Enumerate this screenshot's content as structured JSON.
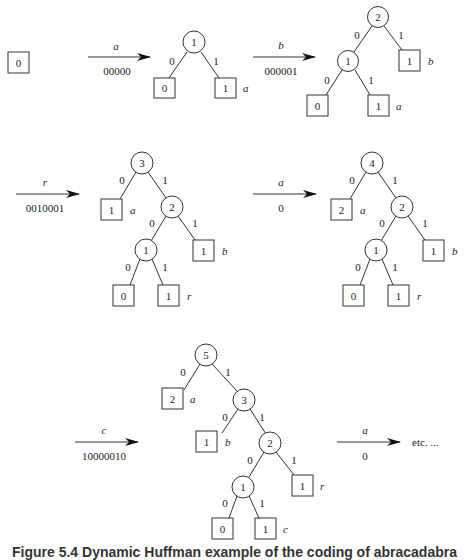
{
  "figure": {
    "caption": "Figure 5.4   Dynamic Huffman example of the coding of abracadabra",
    "etc_label": "etc. ..."
  },
  "initial_tree": {
    "leaf_weight": "0"
  },
  "transitions": [
    {
      "symbol": "a",
      "code": "00000"
    },
    {
      "symbol": "b",
      "code": "000001"
    },
    {
      "symbol": "r",
      "code": "0010001"
    },
    {
      "symbol": "a",
      "code": "0"
    },
    {
      "symbol": "c",
      "code": "10000010"
    },
    {
      "symbol": "a",
      "code": "0"
    }
  ],
  "edge_labels": {
    "left": "0",
    "right": "1"
  },
  "trees": [
    {
      "root": "1",
      "leaves": [
        {
          "weight": "0",
          "symbol": ""
        },
        {
          "weight": "1",
          "symbol": "a"
        }
      ]
    },
    {
      "root": "2",
      "internal": [
        "1"
      ],
      "leaves": [
        {
          "weight": "0",
          "symbol": ""
        },
        {
          "weight": "1",
          "symbol": "a"
        },
        {
          "weight": "1",
          "symbol": "b"
        }
      ]
    },
    {
      "root": "3",
      "internal": [
        "2",
        "1"
      ],
      "leaves": [
        {
          "weight": "1",
          "symbol": "a"
        },
        {
          "weight": "1",
          "symbol": "b"
        },
        {
          "weight": "0",
          "symbol": ""
        },
        {
          "weight": "1",
          "symbol": "r"
        }
      ]
    },
    {
      "root": "4",
      "internal": [
        "2",
        "1"
      ],
      "leaves": [
        {
          "weight": "2",
          "symbol": "a"
        },
        {
          "weight": "1",
          "symbol": "b"
        },
        {
          "weight": "0",
          "symbol": ""
        },
        {
          "weight": "1",
          "symbol": "r"
        }
      ]
    },
    {
      "root": "5",
      "internal": [
        "3",
        "2",
        "1"
      ],
      "leaves": [
        {
          "weight": "2",
          "symbol": "a"
        },
        {
          "weight": "1",
          "symbol": "b"
        },
        {
          "weight": "1",
          "symbol": "r"
        },
        {
          "weight": "0",
          "symbol": ""
        },
        {
          "weight": "1",
          "symbol": "c"
        }
      ]
    }
  ]
}
